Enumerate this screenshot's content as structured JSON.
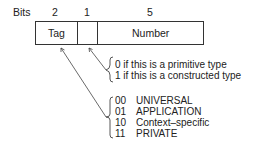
{
  "header": {
    "bits_label": "Bits",
    "widths": [
      "2",
      "1",
      "5"
    ]
  },
  "fields": {
    "tag": "Tag",
    "pc": "",
    "number": "Number"
  },
  "pc_notes": [
    "0 if this is a primitive type",
    "1 if this is a constructed type"
  ],
  "classes": [
    {
      "code": "00",
      "name": "UNIVERSAL"
    },
    {
      "code": "01",
      "name": "APPLICATION"
    },
    {
      "code": "10",
      "name": "Context–specific"
    },
    {
      "code": "11",
      "name": "PRIVATE"
    }
  ]
}
